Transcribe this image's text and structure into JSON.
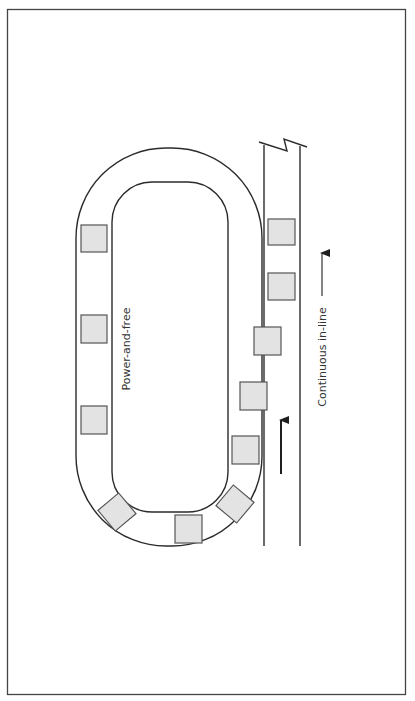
{
  "diagram": {
    "type": "conveyor-layout",
    "labels": {
      "loop": "Power-and-free",
      "line": "Continuous in-line"
    },
    "colors": {
      "stroke": "#2b2b2b",
      "carrier_fill": "#e3e3e3",
      "carrier_stroke": "#555555",
      "background": "#ffffff"
    },
    "carrier_count": 13,
    "arrows": [
      {
        "name": "flow-arrow-line",
        "direction": "up"
      },
      {
        "name": "label-arrow",
        "direction": "up"
      }
    ]
  }
}
